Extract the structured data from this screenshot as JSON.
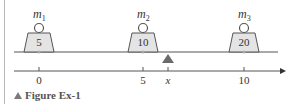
{
  "figure": {
    "caption": "Figure Ex-1",
    "masses": [
      {
        "label": "m",
        "sub": "1",
        "value": "5",
        "position": 0
      },
      {
        "label": "m",
        "sub": "2",
        "value": "10",
        "position": 5
      },
      {
        "label": "m",
        "sub": "3",
        "value": "20",
        "position": 10
      }
    ],
    "axis": {
      "ticks": [
        {
          "label": "0",
          "position": 0
        },
        {
          "label": "5",
          "position": 5
        },
        {
          "label": "x",
          "position": 7,
          "italic": true
        },
        {
          "label": "10",
          "position": 10
        }
      ]
    },
    "fulcrum": {
      "label": "x"
    },
    "colors": {
      "weight_fill": "#e4e4e4",
      "line": "#555555",
      "fulcrum": "#6b6b6b",
      "caption_icon": "#7a7a7a"
    }
  }
}
